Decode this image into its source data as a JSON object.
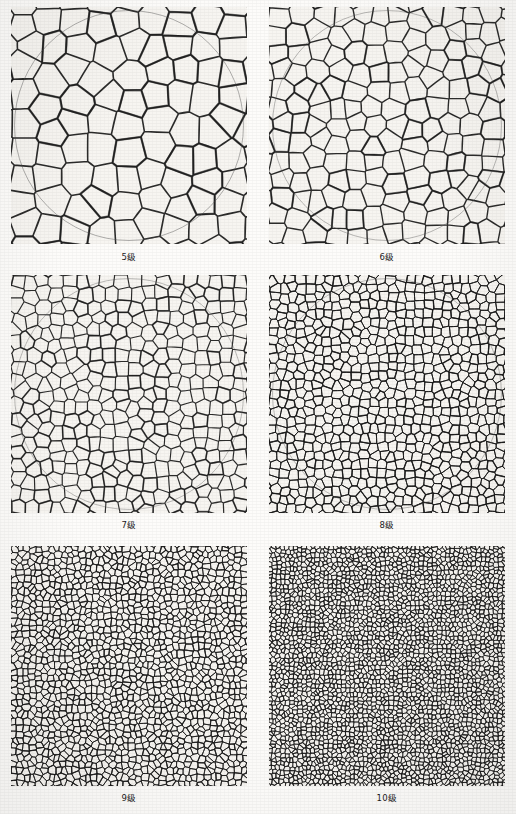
{
  "figure": {
    "background_color": "#fdfcfa",
    "panel_background": "#f7f5f1",
    "ink_color": "#1a1a1a",
    "circle_overlay_color": "#4a4a4a",
    "columns": 2,
    "rows": 3
  },
  "panels": [
    {
      "id": "panel-grade-5",
      "caption": "5级",
      "grade": 5,
      "seed": 5,
      "grain_count": 120,
      "line_width": 1.55,
      "has_circle_overlay": true,
      "circle": {
        "cx": 0.5,
        "cy": 0.5,
        "r": 0.485
      }
    },
    {
      "id": "panel-grade-6",
      "caption": "6级",
      "grade": 6,
      "seed": 6,
      "grain_count": 215,
      "line_width": 1.35,
      "has_circle_overlay": true,
      "circle": {
        "cx": 0.5,
        "cy": 0.5,
        "r": 0.485
      }
    },
    {
      "id": "panel-grade-7",
      "caption": "7级",
      "grade": 7,
      "seed": 7,
      "grain_count": 420,
      "line_width": 1.15,
      "has_circle_overlay": true,
      "circle": {
        "cx": 0.5,
        "cy": 0.5,
        "r": 0.485
      }
    },
    {
      "id": "panel-grade-8",
      "caption": "8级",
      "grade": 8,
      "seed": 8,
      "grain_count": 820,
      "line_width": 1.0,
      "has_circle_overlay": true,
      "circle": {
        "cx": 0.5,
        "cy": 0.5,
        "r": 0.485
      }
    },
    {
      "id": "panel-grade-9",
      "caption": "9级",
      "grade": 9,
      "seed": 9,
      "grain_count": 1650,
      "line_width": 0.85,
      "has_circle_overlay": false,
      "circle": {
        "cx": 0.5,
        "cy": 0.5,
        "r": 0.485
      }
    },
    {
      "id": "panel-grade-10",
      "caption": "10级",
      "grade": 10,
      "seed": 10,
      "grain_count": 3300,
      "line_width": 0.75,
      "has_circle_overlay": false,
      "circle": {
        "cx": 0.5,
        "cy": 0.5,
        "r": 0.485
      }
    }
  ]
}
